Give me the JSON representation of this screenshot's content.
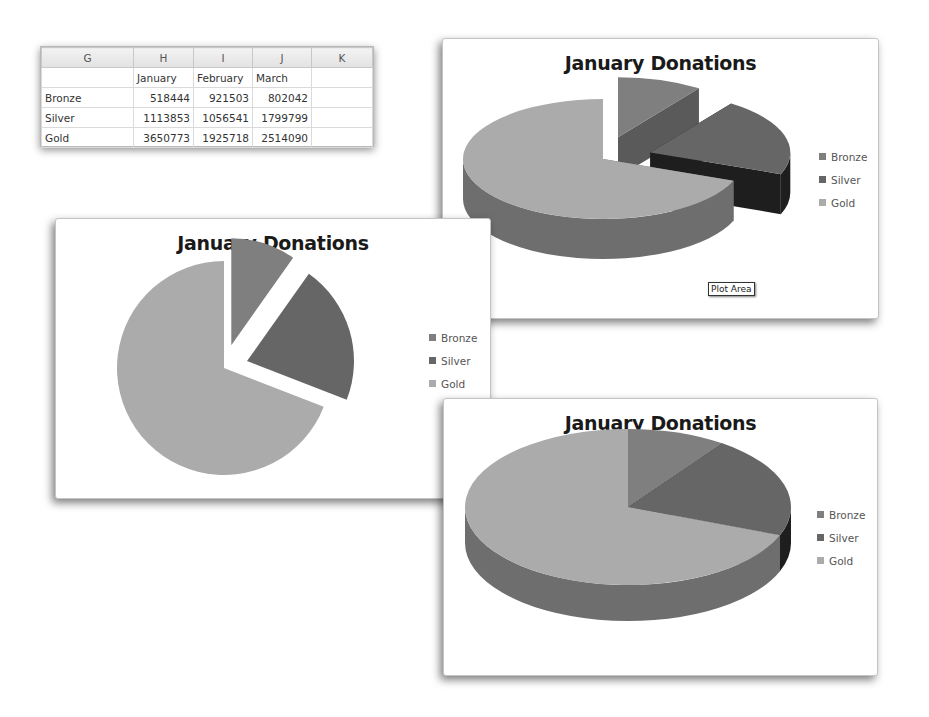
{
  "spreadsheet": {
    "column_headers": [
      "G",
      "H",
      "I",
      "J",
      "K"
    ],
    "header_row": [
      "",
      "January",
      "February",
      "March",
      ""
    ],
    "rows": [
      {
        "label": "Bronze",
        "values": [
          "518444",
          "921503",
          "802042"
        ]
      },
      {
        "label": "Silver",
        "values": [
          "1113853",
          "1056541",
          "1799799"
        ]
      },
      {
        "label": "Gold",
        "values": [
          "3650773",
          "1925718",
          "2514090"
        ]
      }
    ]
  },
  "colors": {
    "Bronze": "#7f7f7f",
    "Silver": "#666666",
    "Gold": "#ababab",
    "Bronze_side": "#5a5a5a",
    "Silver_side": "#1e1e1e",
    "Gold_side": "#6e6e6e"
  },
  "tooltip": "Plot Area",
  "chart_data": [
    {
      "type": "pie",
      "variant": "3d-exploded",
      "title": "January Donations",
      "categories": [
        "Bronze",
        "Silver",
        "Gold"
      ],
      "values": [
        518444,
        1113853,
        3650773
      ],
      "exploded": [
        "Bronze",
        "Silver"
      ],
      "legend": {
        "entries": [
          "Bronze",
          "Silver",
          "Gold"
        ],
        "position": "right"
      }
    },
    {
      "type": "pie",
      "variant": "2d-exploded",
      "title": "January Donations",
      "categories": [
        "Bronze",
        "Silver",
        "Gold"
      ],
      "values": [
        518444,
        1113853,
        3650773
      ],
      "exploded": [
        "Bronze",
        "Silver"
      ],
      "legend": {
        "entries": [
          "Bronze",
          "Silver",
          "Gold"
        ],
        "position": "right"
      }
    },
    {
      "type": "pie",
      "variant": "3d",
      "title": "January Donations",
      "categories": [
        "Bronze",
        "Silver",
        "Gold"
      ],
      "values": [
        518444,
        1113853,
        3650773
      ],
      "exploded": [],
      "legend": {
        "entries": [
          "Bronze",
          "Silver",
          "Gold"
        ],
        "position": "right"
      }
    }
  ]
}
